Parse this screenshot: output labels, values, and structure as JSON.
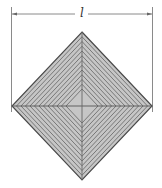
{
  "figure": {
    "dimension_label": "l",
    "nested_square_count": 13,
    "colors": {
      "fill": "#c6c6c6",
      "inner_lines": "#6e6e6e",
      "outline": "#4a4a4a",
      "dimension_lines": "#8a8a8a",
      "background": "#ffffff"
    }
  }
}
